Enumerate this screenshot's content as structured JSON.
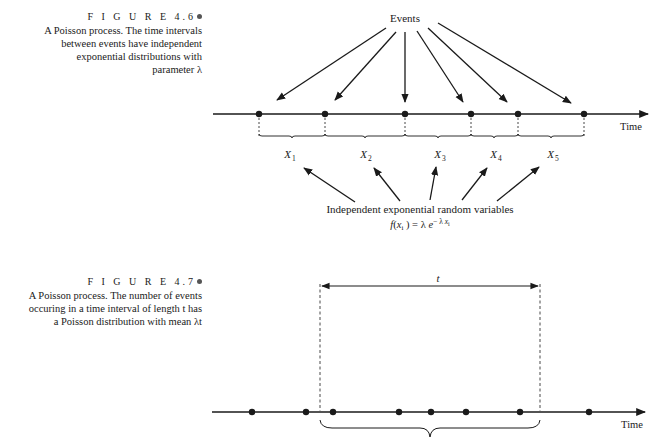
{
  "figure_4_6": {
    "label": "F I G U R E  4.6",
    "caption_lines": [
      "A Poisson process. The time intervals",
      "between events have independent",
      "exponential distributions with",
      "parameter λ"
    ],
    "events_label": "Events",
    "axis_label": "Time",
    "event_positions_x": [
      259,
      325,
      405,
      471,
      518,
      584
    ],
    "interval_labels": [
      "X",
      "X",
      "X",
      "X",
      "X"
    ],
    "interval_subscripts": [
      "1",
      "2",
      "3",
      "4",
      "5"
    ],
    "rv_label": "Independent exponential random variables",
    "density_formula": "f(x_i) = λ e^(−λ x_i)"
  },
  "figure_4_7": {
    "label": "F I G U R E  4.7",
    "caption_lines": [
      "A Poisson process.  The number of events",
      "occuring in a time interval of length t has",
      "a Poisson distribution with mean λt"
    ],
    "interval_label": "t",
    "axis_label": "Time",
    "event_positions_x": [
      252,
      306,
      333,
      399,
      431,
      466,
      520,
      589
    ],
    "interval_start_x": 320,
    "interval_end_x": 540
  }
}
